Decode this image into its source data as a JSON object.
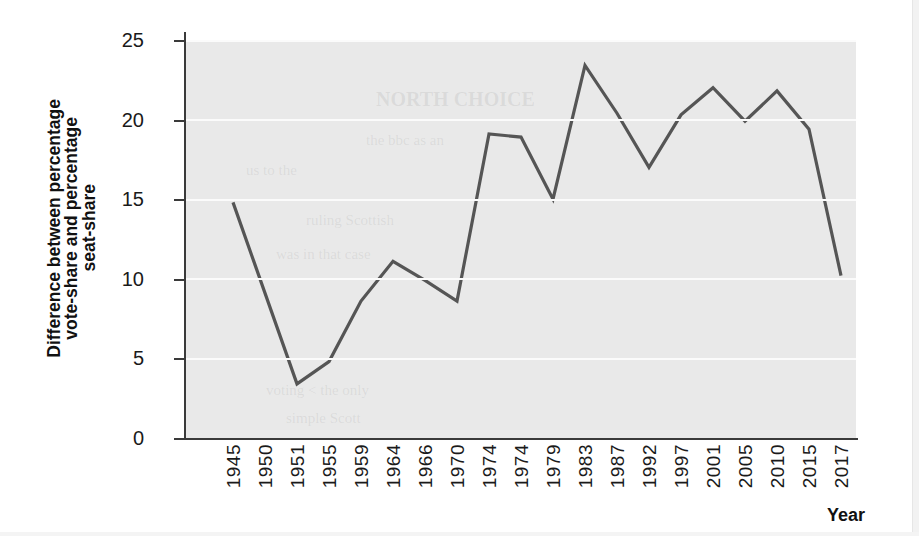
{
  "chart_data": {
    "type": "line",
    "title": "",
    "xlabel": "Year",
    "ylabel": "Difference between percentage vote-share and percentage seat-share",
    "ylabel_lines": [
      "Difference between percentage",
      "vote-share and percentage",
      "seat-share"
    ],
    "categories": [
      "1945",
      "1950",
      "1951",
      "1955",
      "1959",
      "1964",
      "1966",
      "1970",
      "1974",
      "1974",
      "1979",
      "1983",
      "1987",
      "1992",
      "1997",
      "2001",
      "2005",
      "2010",
      "2015",
      "2017"
    ],
    "values": [
      14.8,
      9.1,
      3.4,
      4.8,
      8.6,
      11.1,
      9.9,
      8.6,
      19.1,
      18.9,
      15.0,
      23.4,
      20.4,
      17.0,
      20.3,
      22.0,
      19.9,
      21.8,
      19.4,
      10.2
    ],
    "yticks": [
      0,
      5,
      10,
      15,
      20,
      25
    ],
    "ytick_labels": [
      "0",
      "5",
      "10",
      "15",
      "20",
      "25"
    ],
    "ylim": [
      0,
      25
    ],
    "grid": true,
    "legend": "none",
    "line_color": "#555555",
    "plot_background": "#e9e9e9",
    "gridline_color": "#fbfbfb",
    "page_background": "#ffffff"
  },
  "ghost_text": {
    "lines": [
      "NORTH CHOICE",
      "the bbc as an",
      "us to the",
      "ruling Scottish",
      "was in that case",
      "voting < the only",
      "simple Scott"
    ]
  }
}
